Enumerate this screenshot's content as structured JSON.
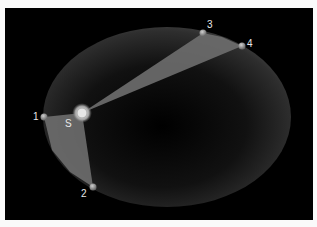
{
  "diagram": {
    "colors": {
      "background": "#000000",
      "frame": "#fafafa",
      "orbit_fill": "#4a4a4a",
      "swept_area": "#6e6e6e",
      "planet": "#9a9a9a",
      "sun": "#d8d8d8",
      "label": "#e8e8e8"
    },
    "sun": {
      "label": "S",
      "x": 82,
      "y": 113
    },
    "orbit": {
      "cx": 167,
      "cy": 117,
      "rx": 124,
      "ry": 90
    },
    "points": [
      {
        "label": "1",
        "x": 44,
        "y": 117
      },
      {
        "label": "2",
        "x": 93,
        "y": 187
      },
      {
        "label": "3",
        "x": 203,
        "y": 33
      },
      {
        "label": "4",
        "x": 242,
        "y": 46
      }
    ]
  }
}
